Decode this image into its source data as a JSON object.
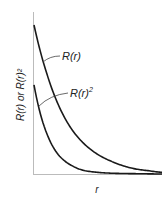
{
  "chart_data": {
    "type": "line",
    "title": "",
    "xlabel": "r",
    "ylabel": "R(r) or R(r)²",
    "xlim": [
      0,
      1
    ],
    "ylim": [
      0,
      1
    ],
    "grid": false,
    "legend": "none (curves annotated inline)",
    "series": [
      {
        "name": "R(r)",
        "label": "R(r)",
        "description": "exponential decay, higher starting value, slower decay",
        "x": [
          0,
          0.1,
          0.2,
          0.3,
          0.4,
          0.5,
          0.6,
          0.7,
          0.8,
          0.9,
          1.0
        ],
        "values": [
          0.92,
          0.62,
          0.41,
          0.27,
          0.18,
          0.12,
          0.08,
          0.05,
          0.03,
          0.02,
          0.01
        ]
      },
      {
        "name": "R(r)^2",
        "label_base": "R(r)",
        "label_sup": "2",
        "description": "square of R(r): lower start, faster decay",
        "x": [
          0,
          0.1,
          0.2,
          0.3,
          0.4,
          0.5,
          0.6,
          0.7,
          0.8,
          0.9,
          1.0
        ],
        "values": [
          0.55,
          0.25,
          0.11,
          0.05,
          0.02,
          0.01,
          0.005,
          0.003,
          0.002,
          0.001,
          0.0
        ]
      }
    ]
  }
}
